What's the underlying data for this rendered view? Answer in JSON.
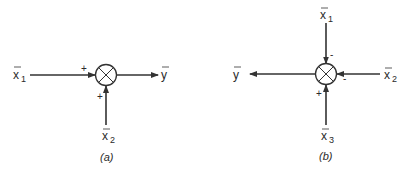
{
  "diagram_a": {
    "caption": "(a)",
    "junction": "summing-junction",
    "inputs": [
      {
        "base": "x",
        "sub": "1",
        "sign": "+",
        "direction": "from-left"
      },
      {
        "base": "x",
        "sub": "2",
        "sign": "+",
        "direction": "from-below"
      }
    ],
    "output": {
      "base": "y",
      "direction": "to-right"
    }
  },
  "diagram_b": {
    "caption": "(b)",
    "junction": "summing-junction",
    "inputs": [
      {
        "base": "x",
        "sub": "1",
        "sign": "-",
        "direction": "from-above"
      },
      {
        "base": "x",
        "sub": "2",
        "sign": "-",
        "direction": "from-right"
      },
      {
        "base": "x",
        "sub": "3",
        "sign": "+",
        "direction": "from-below"
      }
    ],
    "output": {
      "base": "y",
      "direction": "to-left"
    }
  },
  "colors": {
    "ink": "#333333",
    "background": "#ffffff"
  }
}
